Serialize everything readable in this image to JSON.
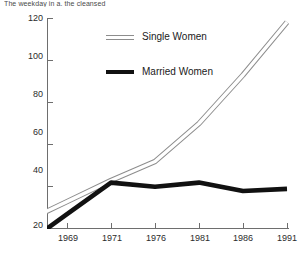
{
  "caption": {
    "text": "The weekday in a. the cleansed"
  },
  "legend": {
    "position": "inside-top-left",
    "entries": [
      {
        "label": "Single Women",
        "style": "hollow-double-line",
        "color": "#8d8d8d"
      },
      {
        "label": "Married Women",
        "style": "thick-solid-line",
        "color": "#111111"
      }
    ]
  },
  "axis": {
    "y_ticks": [
      20,
      40,
      60,
      80,
      100,
      120
    ],
    "x_ticks": [
      "1969",
      "1971",
      "1976",
      "1981",
      "1986",
      "1991"
    ]
  },
  "chart_data": {
    "type": "line",
    "title": "",
    "subtitle": "",
    "xlabel": "",
    "ylabel": "",
    "categories": [
      "1969",
      "1971",
      "1976",
      "1981",
      "1986",
      "1991"
    ],
    "x": [
      1969,
      1971,
      1976,
      1981,
      1986,
      1991
    ],
    "ylim": [
      20,
      120
    ],
    "xlim": [
      1969,
      1991
    ],
    "grid": false,
    "legend_position": "inside-top-left",
    "series": [
      {
        "name": "Single Women",
        "color": "#8d8d8d",
        "style": "hollow-double-line",
        "values": [
          33,
          43,
          52,
          70,
          93,
          118
        ]
      },
      {
        "name": "Married Women",
        "color": "#111111",
        "style": "thick-solid-line",
        "values": [
          27,
          42,
          40,
          42,
          38,
          39
        ]
      }
    ],
    "annotations": []
  }
}
